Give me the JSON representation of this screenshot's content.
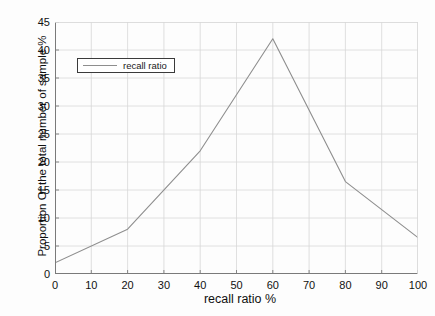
{
  "chart_data": {
    "type": "line",
    "title": "",
    "xlabel": "recall ratio %",
    "ylabel": "Proportion Of the total number of sample %",
    "xlim": [
      0,
      100
    ],
    "ylim": [
      0,
      45
    ],
    "xticks": [
      "0",
      "10",
      "20",
      "30",
      "40",
      "50",
      "60",
      "70",
      "80",
      "90",
      "100"
    ],
    "yticks": [
      "0",
      "5",
      "10",
      "15",
      "20",
      "25",
      "30",
      "35",
      "40",
      "45"
    ],
    "grid": true,
    "legend_position": "upper-left",
    "series": [
      {
        "name": "recall ratio",
        "color": "#8e8e8e",
        "x": [
          0,
          20,
          40,
          60,
          80,
          100
        ],
        "values": [
          2,
          8,
          22,
          42,
          16.5,
          6.5
        ]
      }
    ]
  },
  "legend": {
    "entries": [
      {
        "label": "recall ratio"
      }
    ]
  },
  "axes": {
    "x_title": "recall ratio %",
    "y_title": "Proportion Of the total number of sample %"
  },
  "colors": {
    "line": "#8e8e8e",
    "grid": "#d8d8d8",
    "axis": "#7a7a7a",
    "text": "#101010",
    "background": "#fdfdfd"
  }
}
